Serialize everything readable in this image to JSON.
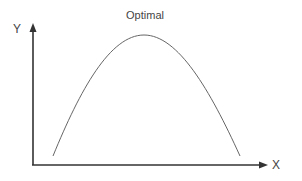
{
  "diagram": {
    "title": "Optimal",
    "x_axis_label": "X",
    "y_axis_label": "Y",
    "curve": "inverted-U (parabola) rising from low-left, peaking at center, falling to low-right",
    "colors": {
      "axis": "#333333",
      "curve": "#666666",
      "text": "#444444"
    }
  }
}
